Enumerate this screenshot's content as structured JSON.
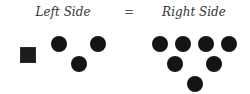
{
  "equation": {
    "left_label": "Left Side",
    "equals_sign": "=",
    "right_label": "Right Side"
  },
  "left_side": {
    "shapes": [
      {
        "type": "square",
        "x": 20,
        "y": 47
      },
      {
        "type": "circle",
        "x": 51,
        "y": 36
      },
      {
        "type": "circle",
        "x": 90,
        "y": 36
      },
      {
        "type": "circle",
        "x": 71,
        "y": 56
      }
    ],
    "square_count": 1,
    "circle_count": 3
  },
  "right_side": {
    "shapes": [
      {
        "type": "circle",
        "x": 152,
        "y": 36
      },
      {
        "type": "circle",
        "x": 175,
        "y": 36
      },
      {
        "type": "circle",
        "x": 198,
        "y": 36
      },
      {
        "type": "circle",
        "x": 221,
        "y": 36
      },
      {
        "type": "circle",
        "x": 167,
        "y": 56
      },
      {
        "type": "circle",
        "x": 206,
        "y": 56
      },
      {
        "type": "circle",
        "x": 187,
        "y": 76
      }
    ],
    "circle_count": 7
  },
  "colors": {
    "shape_fill": "#141414",
    "text": "#333333",
    "background": "#ffffff"
  }
}
